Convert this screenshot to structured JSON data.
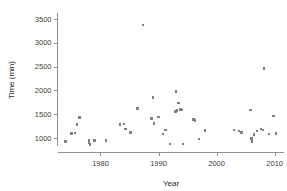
{
  "chart_data": {
    "type": "scatter",
    "title": "",
    "xlabel": "Year",
    "ylabel": "Time (min)",
    "xlim": [
      1972.6,
      2011.6
    ],
    "ylim": [
      700,
      3620
    ],
    "grid": false,
    "legend": null,
    "marker": {
      "shape": "square",
      "size_px": 2.4,
      "color": "#808080"
    },
    "xticks": [
      1980,
      1990,
      2000,
      2010
    ],
    "xticklabels": [
      "1980",
      "1990",
      "2000",
      "2010"
    ],
    "yticks": [
      1000,
      1500,
      2000,
      2500,
      3000,
      3500
    ],
    "yticklabels": [
      "1000",
      "1500",
      "2000",
      "2500",
      "3000",
      "3500"
    ],
    "x": [
      1974.0,
      1975.0,
      1975.6,
      1976.0,
      1976.4,
      1978.0,
      1978.0,
      1978.2,
      1979.0,
      1981.0,
      1983.4,
      1984.0,
      1984.3,
      1985.2,
      1986.4,
      1987.3,
      1988.8,
      1989.0,
      1989.2,
      1990.0,
      1990.8,
      1991.2,
      1992.0,
      1992.9,
      1993.0,
      1993.2,
      1993.4,
      1993.8,
      1994.0,
      1994.2,
      1996.0,
      1996.3,
      1997.0,
      1998.0,
      2003.0,
      2003.8,
      2004.3,
      2005.8,
      2006.0,
      2006.1,
      2006.4,
      2007.0,
      2007.6,
      2008.0,
      2008.2,
      2009.0,
      2009.8,
      2010.2
    ],
    "y": [
      930,
      1095,
      1110,
      1285,
      1435,
      905,
      950,
      870,
      950,
      955,
      1290,
      1300,
      1190,
      1115,
      1620,
      3370,
      1410,
      1855,
      1305,
      1440,
      1085,
      1170,
      880,
      1560,
      1975,
      1580,
      1735,
      1600,
      1590,
      880,
      1390,
      1370,
      985,
      1160,
      1165,
      1150,
      1115,
      1590,
      990,
      930,
      1075,
      1155,
      1195,
      1175,
      2455,
      1085,
      1465,
      1095
    ],
    "n_points": 48
  }
}
